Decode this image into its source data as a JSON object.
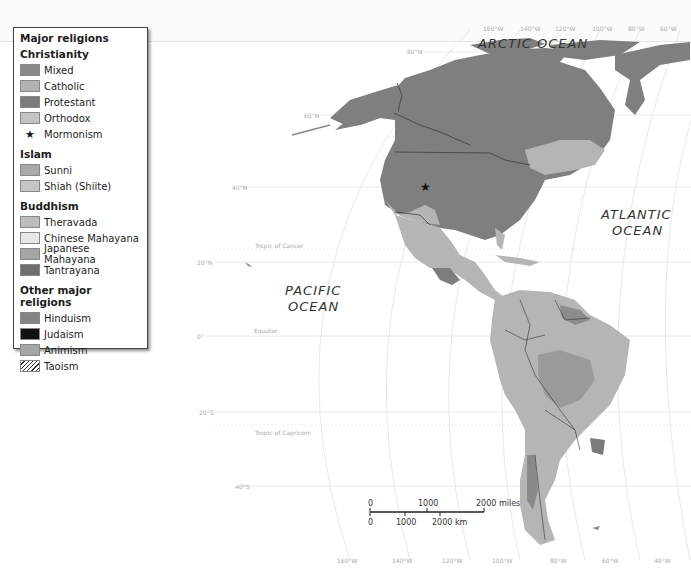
{
  "legend": {
    "title": "Major religions",
    "groups": [
      {
        "heading": "Christianity",
        "items": [
          {
            "label": "Mixed",
            "color": "#8a8a8a"
          },
          {
            "label": "Catholic",
            "color": "#b2b2b2"
          },
          {
            "label": "Protestant",
            "color": "#7c7c7c"
          },
          {
            "label": "Orthodox",
            "color": "#c4c4c4"
          },
          {
            "label": "Mormonism",
            "symbol": "★"
          }
        ]
      },
      {
        "heading": "Islam",
        "items": [
          {
            "label": "Sunni",
            "color": "#a9a9a9"
          },
          {
            "label": "Shiah (Shiite)",
            "color": "#c6c6c6"
          }
        ]
      },
      {
        "heading": "Buddhism",
        "items": [
          {
            "label": "Theravada",
            "color": "#bdbdbd"
          },
          {
            "label": "Chinese Mahayana",
            "color": "#e6e6e6"
          },
          {
            "label": "Japanese Mahayana",
            "color": "#a5a5a5"
          },
          {
            "label": "Tantrayana",
            "color": "#6f6f6f"
          }
        ]
      },
      {
        "heading": "Other major religions",
        "items": [
          {
            "label": "Hinduism",
            "color": "#858585"
          },
          {
            "label": "Judaism",
            "color": "#111111"
          },
          {
            "label": "Animism",
            "color": "#a6a6a6"
          },
          {
            "label": "Taoism",
            "pattern": "hatch"
          }
        ]
      }
    ]
  },
  "oceans": {
    "arctic": "ARCTIC OCEAN",
    "pacific_1": "PACIFIC",
    "pacific_2": "OCEAN",
    "atlantic_1": "ATLANTIC",
    "atlantic_2": "OCEAN"
  },
  "graticule": {
    "top_longitudes": [
      "160°W",
      "140°W",
      "120°W",
      "100°W",
      "80°W",
      "60°W"
    ],
    "bottom_longitudes": [
      "160°W",
      "140°W",
      "120°W",
      "100°W",
      "80°W",
      "60°W",
      "40°W"
    ],
    "latitudes": [
      "80°N",
      "60°N",
      "40°N",
      "20°N",
      "0°",
      "20°S",
      "40°S"
    ],
    "special_lines": [
      "Tropic of Cancer",
      "Equator",
      "Tropic of Capricorn"
    ]
  },
  "scale_bar": {
    "miles_ticks": [
      "0",
      "1000",
      "2000 miles"
    ],
    "km_ticks": [
      "0",
      "1000",
      "2000 km"
    ]
  }
}
